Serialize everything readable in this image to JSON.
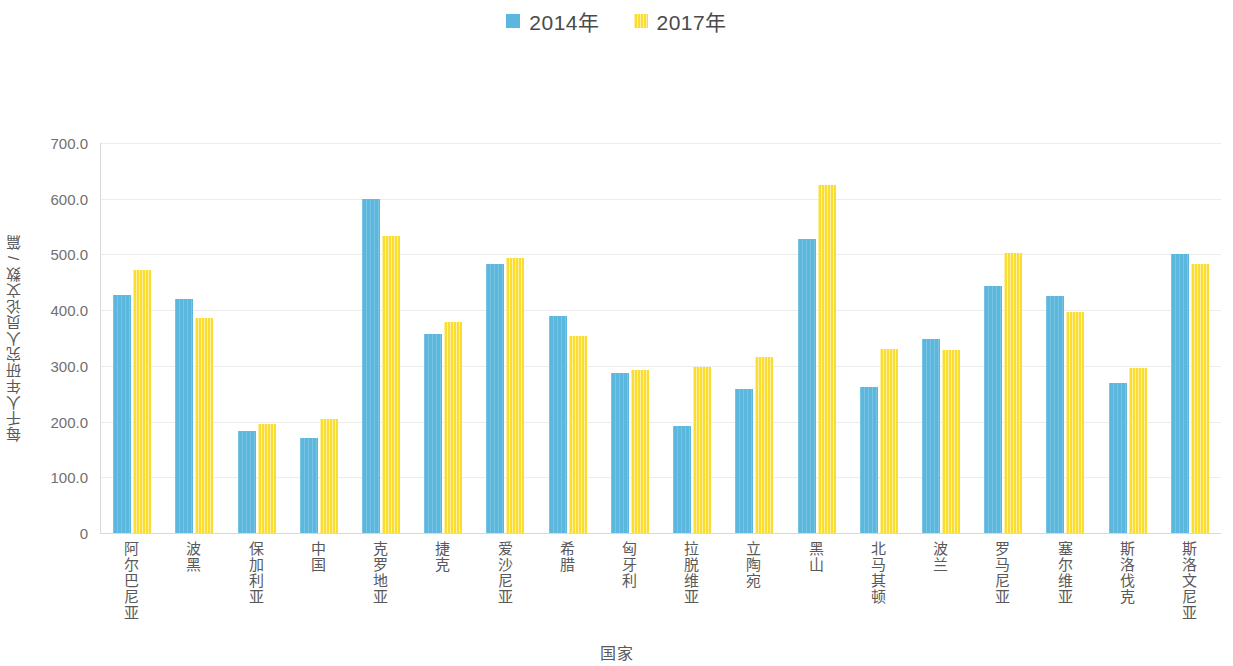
{
  "chart_data": {
    "type": "bar",
    "title": "",
    "xlabel": "国家",
    "ylabel": "每千人年研究人员论文数 / 篇",
    "ylim": [
      0,
      700
    ],
    "grid": true,
    "legend_position": "top-center",
    "y_ticks": [
      "0",
      "100.0",
      "200.0",
      "300.0",
      "400.0",
      "500.0",
      "600.0",
      "700.0"
    ],
    "y_tick_values": [
      0,
      100,
      200,
      300,
      400,
      500,
      600,
      700
    ],
    "categories": [
      "阿尔巴尼亚",
      "波黑",
      "保加利亚",
      "中国",
      "克罗地亚",
      "捷克",
      "爱沙尼亚",
      "希腊",
      "匈牙利",
      "拉脱维亚",
      "立陶宛",
      "黑山",
      "北马其顿",
      "波兰",
      "罗马尼亚",
      "塞尔维亚",
      "斯洛伐克",
      "斯洛文尼亚"
    ],
    "series": [
      {
        "name": "2014年",
        "color": "#5bb7de",
        "values": [
          428,
          420,
          184,
          170,
          600,
          358,
          483,
          390,
          288,
          192,
          258,
          528,
          262,
          348,
          443,
          425,
          270,
          500
        ]
      },
      {
        "name": "2017年",
        "color": "#fadd2e",
        "values": [
          472,
          386,
          196,
          205,
          533,
          378,
          493,
          354,
          293,
          298,
          316,
          625,
          330,
          328,
          503,
          396,
          297,
          483
        ]
      }
    ]
  },
  "legend": {
    "entries": [
      {
        "label": "2014年",
        "swatch": "blue"
      },
      {
        "label": "2017年",
        "swatch": "yellow"
      }
    ]
  }
}
